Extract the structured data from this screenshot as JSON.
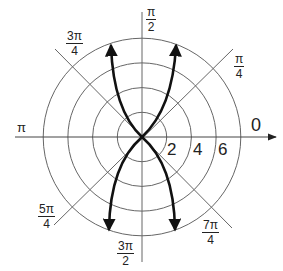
{
  "diagram": {
    "type": "polar-graph",
    "center": [
      142,
      137
    ],
    "ring_spacing_px": 24.7,
    "rings": [
      2,
      4,
      6,
      8
    ],
    "radial_tick_labels": [
      "2",
      "4",
      "6"
    ],
    "angle_labels": {
      "zero": "0",
      "pi_over_4": {
        "num": "π",
        "den": "4"
      },
      "pi_over_2": {
        "num": "π",
        "den": "2"
      },
      "three_pi_over_4": {
        "num": "3π",
        "den": "4"
      },
      "pi": "π",
      "five_pi_over_4": {
        "num": "5π",
        "den": "4"
      },
      "three_pi_over_2": {
        "num": "3π",
        "den": "2"
      },
      "seven_pi_over_4": {
        "num": "7π",
        "den": "4"
      }
    },
    "curve": {
      "description": "Two symmetric bold branches crossing at the pole, opening upward and downward, with arrowheads at all four ends",
      "stroke_color": "#111111",
      "arrow_tips": [
        [
          111,
          44
        ],
        [
          176,
          44
        ],
        [
          109,
          231
        ],
        [
          175,
          231
        ]
      ]
    },
    "colors": {
      "grid": "#555555",
      "curve": "#111111",
      "text": "#222222",
      "background": "#ffffff"
    }
  }
}
